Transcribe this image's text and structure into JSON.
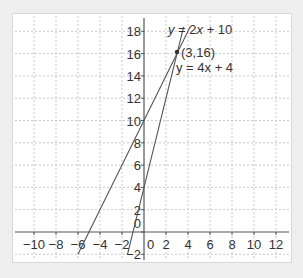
{
  "chart_data": {
    "type": "line",
    "title": "",
    "xlabel": "",
    "ylabel": "",
    "xlim": [
      -11,
      13
    ],
    "ylim": [
      -2.5,
      19
    ],
    "grid": true,
    "x_ticks": [
      -10,
      -8,
      -6,
      -4,
      -2,
      0,
      2,
      4,
      6,
      8,
      10,
      12
    ],
    "y_ticks": [
      -2,
      0,
      2,
      4,
      6,
      8,
      10,
      12,
      14,
      16,
      18
    ],
    "x_tick_labels": [
      "−10",
      "−8",
      "−6",
      "−4",
      "−2",
      "0",
      "2",
      "4",
      "6",
      "8",
      "10",
      "12"
    ],
    "y_tick_labels": [
      "−2",
      "0",
      "2",
      "4",
      "6",
      "8",
      "10",
      "12",
      "14",
      "16",
      "18"
    ],
    "series": [
      {
        "name": "y = 2x + 10",
        "slope": 2,
        "intercept": 10,
        "x": [
          -6,
          4.2
        ],
        "y": [
          -2,
          18.4
        ]
      },
      {
        "name": "y = 4x + 4",
        "slope": 4,
        "intercept": 4,
        "x": [
          -1.5,
          3.6
        ],
        "y": [
          -2,
          18.4
        ]
      }
    ],
    "annotations": [
      {
        "text": "y = 2x + 10",
        "x": 3.8,
        "y": 18
      },
      {
        "text": "(3,16)",
        "x": 3,
        "y": 16,
        "marker": "point"
      },
      {
        "text": "y = 4x + 4",
        "x": 3.2,
        "y": 14.4
      }
    ],
    "intersection": {
      "x": 3,
      "y": 16,
      "label": "(3,16)"
    }
  },
  "labels": {
    "eq1_prefix": "y",
    "eq1_rest": " = 2",
    "eq1_x": "x",
    "eq1_tail": " + 10",
    "point": "(3,16)",
    "eq2": "y = 4x + 4"
  },
  "colors": {
    "line": "#555555",
    "axis": "#555555",
    "grid": "#c8c8c8",
    "text": "#333333"
  }
}
